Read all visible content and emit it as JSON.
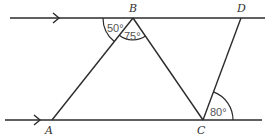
{
  "diagram": {
    "type": "geometry",
    "points": {
      "A": {
        "label": "A",
        "x": 52,
        "y": 120
      },
      "B": {
        "label": "B",
        "x": 133,
        "y": 18
      },
      "C": {
        "label": "C",
        "x": 203,
        "y": 120
      },
      "D": {
        "label": "D",
        "x": 241,
        "y": 18
      }
    },
    "parallel_lines": [
      {
        "name": "top-line",
        "marker": "arrow"
      },
      {
        "name": "bottom-line",
        "marker": "arrow"
      }
    ],
    "segments": [
      "AB",
      "BC",
      "CD"
    ],
    "angles": [
      {
        "at": "B",
        "label": "50°"
      },
      {
        "at": "B",
        "label": "75°"
      },
      {
        "at": "C",
        "label": "80°"
      }
    ]
  }
}
